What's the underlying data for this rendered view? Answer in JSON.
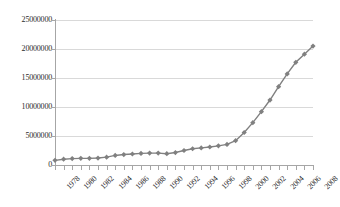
{
  "chart_data": {
    "type": "line",
    "title": "",
    "xlabel": "",
    "ylabel": "",
    "ylim": [
      0,
      25000000
    ],
    "grid": true,
    "legend": "none",
    "marker": "diamond",
    "series_color": "#808080",
    "gridline_color": "#d9d9d9",
    "axis_color": "#a6a6a6",
    "y_ticks": [
      0,
      5000000,
      10000000,
      15000000,
      20000000,
      25000000
    ],
    "y_tick_labels": [
      "0",
      "5000000",
      "10000000",
      "15000000",
      "20000000",
      "25000000"
    ],
    "x_tick_labels": [
      "1978",
      "1980",
      "1982",
      "1984",
      "1986",
      "1988",
      "1990",
      "1992",
      "1994",
      "1996",
      "1998",
      "2000",
      "2002",
      "2004",
      "2006",
      "2008"
    ],
    "x_label_rotation": -45,
    "x": [
      1978,
      1979,
      1980,
      1981,
      1982,
      1983,
      1984,
      1985,
      1986,
      1987,
      1988,
      1989,
      1990,
      1991,
      1992,
      1993,
      1994,
      1995,
      1996,
      1997,
      1998,
      1999,
      2000,
      2001,
      2002,
      2003,
      2004,
      2005,
      2006,
      2007,
      2008
    ],
    "values": [
      800000,
      1000000,
      1100000,
      1150000,
      1150000,
      1200000,
      1350000,
      1650000,
      1800000,
      1900000,
      2000000,
      2050000,
      2050000,
      1950000,
      2150000,
      2500000,
      2800000,
      2950000,
      3100000,
      3300000,
      3550000,
      4200000,
      5600000,
      7300000,
      9200000,
      11200000,
      13500000,
      15700000,
      17700000,
      19100000,
      20500000
    ]
  }
}
